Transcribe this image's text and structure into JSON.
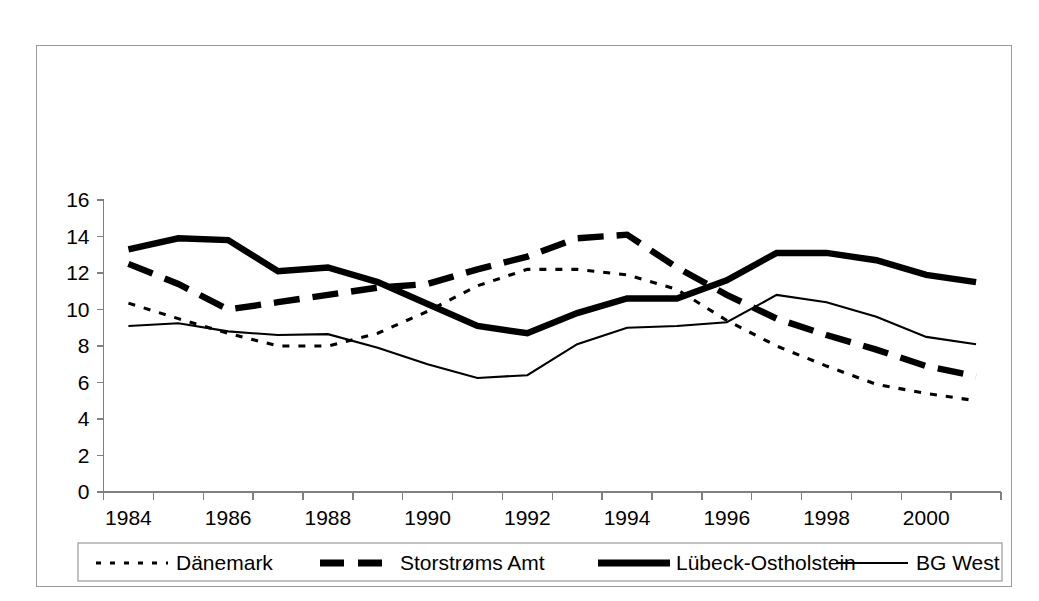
{
  "chart_data": {
    "type": "line",
    "title": "",
    "subtitle": "",
    "xlabel": "",
    "ylabel": "",
    "xlim": [
      1984,
      2001
    ],
    "ylim": [
      0,
      16
    ],
    "ytick_step": 2,
    "grid": false,
    "legend_position": "bottom",
    "x": [
      1984,
      1985,
      1986,
      1987,
      1988,
      1989,
      1990,
      1991,
      1992,
      1993,
      1994,
      1995,
      1996,
      1997,
      1998,
      1999,
      2000,
      2001
    ],
    "xticklabels": [
      "1984",
      "",
      "1986",
      "",
      "1988",
      "",
      "1990",
      "",
      "1992",
      "",
      "1994",
      "",
      "1996",
      "",
      "1998",
      "",
      "2000",
      ""
    ],
    "xticklabels_shown": [
      "1984",
      "1986",
      "1988",
      "1990",
      "1992",
      "1994",
      "1996",
      "1998",
      "2000"
    ],
    "yticklabels": [
      "0",
      "2",
      "4",
      "6",
      "8",
      "10",
      "12",
      "14",
      "16"
    ],
    "yticks": [
      0,
      2,
      4,
      6,
      8,
      10,
      12,
      14,
      16
    ],
    "series": [
      {
        "name": "Dänemark",
        "style": "dotted",
        "values": [
          10.35,
          9.5,
          8.7,
          8.0,
          8.0,
          8.7,
          9.9,
          11.3,
          12.2,
          12.2,
          11.9,
          11.1,
          9.4,
          8.0,
          6.9,
          5.9,
          5.4,
          5.0
        ]
      },
      {
        "name": "Storstrøms Amt",
        "style": "thick-dashed",
        "values": [
          12.5,
          11.4,
          10.0,
          10.4,
          10.8,
          11.2,
          11.4,
          12.2,
          12.9,
          13.9,
          14.1,
          12.3,
          10.8,
          9.5,
          8.6,
          7.8,
          6.9,
          6.35
        ]
      },
      {
        "name": "Lübeck-Ostholstein",
        "style": "thick-solid",
        "values": [
          13.3,
          13.9,
          13.8,
          12.1,
          12.3,
          11.5,
          10.3,
          9.1,
          8.7,
          9.8,
          10.6,
          10.6,
          11.6,
          13.1,
          13.1,
          12.7,
          11.9,
          11.5
        ]
      },
      {
        "name": "BG West",
        "style": "thin-solid",
        "values": [
          9.1,
          9.25,
          8.8,
          8.6,
          8.65,
          7.9,
          7.0,
          6.25,
          6.4,
          8.1,
          9.0,
          9.1,
          9.3,
          10.8,
          10.4,
          9.6,
          8.5,
          8.1
        ]
      }
    ]
  },
  "legend": {
    "items": [
      {
        "label": "Dänemark",
        "style": "dotted"
      },
      {
        "label": "Storstrøms Amt",
        "style": "thick-dashed"
      },
      {
        "label": "Lübeck-Ostholstein",
        "style": "thick-solid"
      },
      {
        "label": "BG West",
        "style": "thin-solid"
      }
    ]
  },
  "colors": {
    "series": "#000000",
    "axis": "#808080",
    "frame": "#9a9a9a",
    "background": "#ffffff"
  }
}
